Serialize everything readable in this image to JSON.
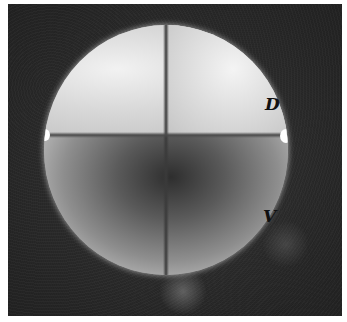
{
  "figure": {
    "labels": {
      "dorsal": "D",
      "ventral": "V"
    }
  }
}
